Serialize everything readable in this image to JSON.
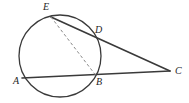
{
  "figure": {
    "name": "circle-secants-diagram",
    "type": "euclidean-geometry-diagram",
    "background_color": "#ffffff",
    "stroke_color": "#3a3a3a",
    "dashed_stroke_color": "#8a8a8a",
    "label_color": "#262626",
    "width": 189,
    "height": 103
  },
  "circle": {
    "name": "main-circle",
    "cx": 60,
    "cy": 56,
    "r": 41,
    "stroke_width": 1.3
  },
  "points": [
    {
      "id": "A",
      "label": "A",
      "x": 22.0,
      "y": 78.0,
      "on_circle": true,
      "label_x": 13,
      "label_y": 76
    },
    {
      "id": "B",
      "label": "B",
      "x": 95.5,
      "y": 75.0,
      "on_circle": true,
      "label_x": 96,
      "label_y": 77
    },
    {
      "id": "C",
      "label": "C",
      "x": 170.0,
      "y": 71.0,
      "on_circle": false,
      "label_x": 175,
      "label_y": 66
    },
    {
      "id": "D",
      "label": "D",
      "x": 94.5,
      "y": 37.0,
      "on_circle": true,
      "label_x": 95,
      "label_y": 25
    },
    {
      "id": "E",
      "label": "E",
      "x": 51.0,
      "y": 17.0,
      "on_circle": true,
      "label_x": 43,
      "label_y": 2
    }
  ],
  "segments": [
    {
      "id": "AC",
      "name": "secant-line-a-b-c",
      "from": "A",
      "to": "C",
      "style": "solid",
      "stroke_width": 1.6
    },
    {
      "id": "EC",
      "name": "secant-line-e-d-c",
      "from": "E",
      "to": "C",
      "style": "solid",
      "stroke_width": 1.6
    },
    {
      "id": "ED",
      "name": "chord-e-d",
      "from": "E",
      "to": "D",
      "style": "solid",
      "stroke_width": 1.5
    },
    {
      "id": "EB",
      "name": "chord-e-b-dashed",
      "from": "E",
      "to": "B",
      "style": "dashed",
      "stroke_width": 1.0,
      "dash_pattern": "3,2.4"
    }
  ],
  "labels": {
    "A": "A",
    "B": "B",
    "C": "C",
    "D": "D",
    "E": "E"
  }
}
